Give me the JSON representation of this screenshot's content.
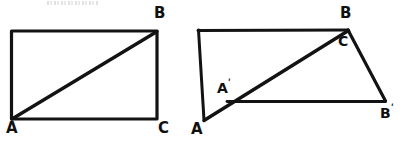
{
  "figure": {
    "kind": "hand-drawn-geometry-diagram",
    "canvas": {
      "width": 407,
      "height": 142,
      "background": "#ffffff"
    },
    "stroke_color": "#131313",
    "artifact": {
      "name": "scan-smudge",
      "description": "faint cut-off text remnant at top"
    },
    "panels": [
      {
        "id": "left",
        "name": "rectangle-with-diagonal",
        "vertices": {
          "top_left": {
            "x": 11,
            "y": 31
          },
          "top_right": {
            "x": 157,
            "y": 31
          },
          "bottom_right": {
            "x": 157,
            "y": 119
          },
          "bottom_left": {
            "x": 11,
            "y": 119
          }
        },
        "diagonal": {
          "from": {
            "x": 11,
            "y": 119
          },
          "to": {
            "x": 157,
            "y": 31
          }
        },
        "labels": [
          {
            "id": "B",
            "text": "B",
            "prime": false,
            "x": 154,
            "y": 6,
            "size": "main"
          },
          {
            "id": "A",
            "text": "A",
            "prime": false,
            "x": 6,
            "y": 121,
            "size": "main"
          },
          {
            "id": "C",
            "text": "C",
            "prime": false,
            "x": 158,
            "y": 121,
            "size": "main"
          }
        ]
      },
      {
        "id": "right",
        "name": "sheared-quadrilateral-with-diagonal",
        "vertices": {
          "top_left": {
            "x": 198,
            "y": 30
          },
          "B": {
            "x": 348,
            "y": 30
          },
          "B_prime": {
            "x": 385,
            "y": 101
          },
          "A_prime": {
            "x": 227,
            "y": 101
          },
          "A": {
            "x": 204,
            "y": 120
          }
        },
        "edges": [
          {
            "name": "top-edge",
            "from": {
              "x": 198,
              "y": 30
            },
            "to": {
              "x": 348,
              "y": 30
            }
          },
          {
            "name": "left-edge",
            "from": {
              "x": 198,
              "y": 30
            },
            "to": {
              "x": 204,
              "y": 120
            }
          },
          {
            "name": "right-edge",
            "from": {
              "x": 348,
              "y": 30
            },
            "to": {
              "x": 385,
              "y": 101
            }
          },
          {
            "name": "bottom-edge",
            "from": {
              "x": 227,
              "y": 101
            },
            "to": {
              "x": 385,
              "y": 101
            }
          },
          {
            "name": "diagonal-A-to-B",
            "from": {
              "x": 204,
              "y": 120
            },
            "to": {
              "x": 348,
              "y": 30
            }
          }
        ],
        "labels": [
          {
            "id": "B",
            "text": "B",
            "prime": false,
            "x": 340,
            "y": 6,
            "size": "main"
          },
          {
            "id": "C-prime",
            "text": "C",
            "prime": true,
            "x": 338,
            "y": 31,
            "size": "prime"
          },
          {
            "id": "A-prime",
            "text": "A",
            "prime": true,
            "x": 217,
            "y": 78,
            "size": "prime"
          },
          {
            "id": "A",
            "text": "A",
            "prime": false,
            "x": 191,
            "y": 122,
            "size": "main"
          },
          {
            "id": "B-prime",
            "text": "B",
            "prime": true,
            "x": 380,
            "y": 103,
            "size": "prime"
          }
        ]
      }
    ]
  }
}
